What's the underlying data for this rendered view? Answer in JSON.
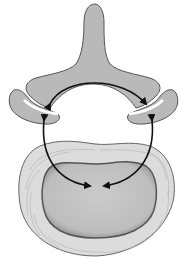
{
  "figure": {
    "parts": [
      {
        "id": "spinous-process",
        "label": ""
      },
      {
        "id": "left-facet",
        "label": ""
      },
      {
        "id": "right-facet",
        "label": ""
      },
      {
        "id": "annulus-fibrosus",
        "label": ""
      },
      {
        "id": "nucleus-pulposus",
        "label": ""
      }
    ],
    "arrows": [
      {
        "id": "posterior-arc",
        "type": "double-headed"
      },
      {
        "id": "left-arc",
        "type": "double-headed"
      },
      {
        "id": "right-arc",
        "type": "double-headed"
      }
    ],
    "colors": {
      "bone": "#b9b9b9",
      "annulus": "#dcdcdc",
      "nucleus": "#c4c4c4",
      "arrow": "#111111",
      "background": "#ffffff"
    }
  }
}
